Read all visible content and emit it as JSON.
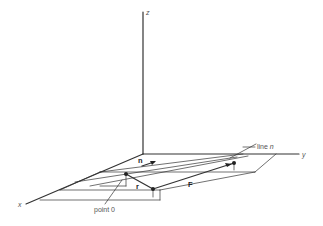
{
  "diagram": {
    "axes": {
      "x_label": "x",
      "y_label": "y",
      "z_label": "z"
    },
    "labels": {
      "line_prefix": "line",
      "line_name": "n",
      "point": "point 0",
      "normal_vector": "n",
      "position_vector": "r",
      "force_vector": "F"
    },
    "colors": {
      "line": "#333333",
      "text": "#555555",
      "background": "#ffffff"
    }
  }
}
